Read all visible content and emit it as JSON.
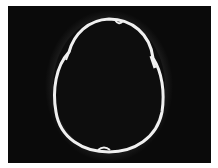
{
  "image": {
    "description": "Axial CT scan of skull showing oval cranial vault outline",
    "colors": {
      "background": "#0a0a0a",
      "bone": "#f2f2f2",
      "soft_tissue": "#2a2a2a",
      "border": "#ffffff"
    }
  }
}
